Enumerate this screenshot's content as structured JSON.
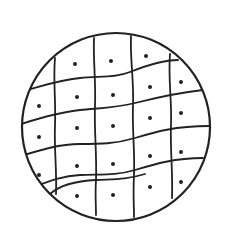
{
  "figure": {
    "stroke_color": "#222222",
    "fill_color": "#ffffff",
    "circle": {
      "cx": 116,
      "cy": 127,
      "r": 94
    },
    "vertical_lines": [
      "M55,58 C53,80 56,100 55,125 C54,150 57,170 56,194",
      "M94,38 C93,60 96,80 95,105 C94,130 97,155 96,180 C95,195 96,205 96,215",
      "M131,36 C130,60 134,80 133,105 C132,130 135,150 134,175 C133,195 134,205 134,217",
      "M170,54 C168,80 172,100 171,125 C170,150 173,170 172,198"
    ],
    "horizontal_lines": [
      "M27,90 C45,85 60,80 80,78 C100,76 115,78 130,72 C150,64 165,60 178,60",
      "M21,124 C40,118 60,112 80,110 C100,108 115,108 135,103 C155,98 175,93 203,90",
      "M21,156 C40,150 60,144 80,144 C100,144 115,144 135,138 C155,132 175,126 209,126",
      "M26,190 C45,183 60,176 80,175 C100,174 115,176 135,170 C155,164 175,158 203,158",
      "M50,194 C60,185 75,181 96,180 C115,179 125,180 145,174"
    ],
    "dots": [
      [
        75,
        64
      ],
      [
        111,
        61
      ],
      [
        146,
        56
      ],
      [
        39,
        106
      ],
      [
        77,
        97
      ],
      [
        113,
        95
      ],
      [
        150,
        87
      ],
      [
        181,
        82
      ],
      [
        39,
        137
      ],
      [
        77,
        128
      ],
      [
        113,
        126
      ],
      [
        150,
        118
      ],
      [
        181,
        113
      ],
      [
        39,
        175
      ],
      [
        77,
        166
      ],
      [
        113,
        164
      ],
      [
        150,
        156
      ],
      [
        181,
        152
      ],
      [
        77,
        196
      ],
      [
        113,
        195
      ],
      [
        150,
        187
      ],
      [
        181,
        182
      ]
    ],
    "dot_radius": 2
  }
}
